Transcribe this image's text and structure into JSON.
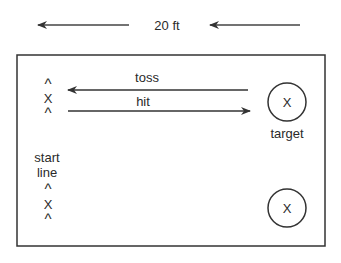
{
  "diagram": {
    "distance": {
      "label": "20 ft",
      "arrow_left": {
        "x1": 129,
        "x2": 37,
        "y": 25,
        "direction": "left"
      },
      "arrow_right": {
        "x1": 300,
        "x2": 209,
        "y": 25,
        "direction": "left"
      }
    },
    "field": {
      "x": 17,
      "y": 55,
      "width": 308,
      "height": 191
    },
    "toss": {
      "label": "toss",
      "direction": "left"
    },
    "hit": {
      "label": "hit",
      "direction": "right"
    },
    "player_top": {
      "symbols": [
        "^",
        "X",
        "^"
      ]
    },
    "player_bottom": {
      "symbols": [
        "^",
        "X",
        "^"
      ]
    },
    "start_line": {
      "line1": "start",
      "line2": "line"
    },
    "target_top": {
      "mark": "X",
      "label": "target"
    },
    "target_bottom": {
      "mark": "X"
    },
    "colors": {
      "stroke": "#333333",
      "text": "#2a2a2a",
      "background": "#ffffff"
    }
  }
}
